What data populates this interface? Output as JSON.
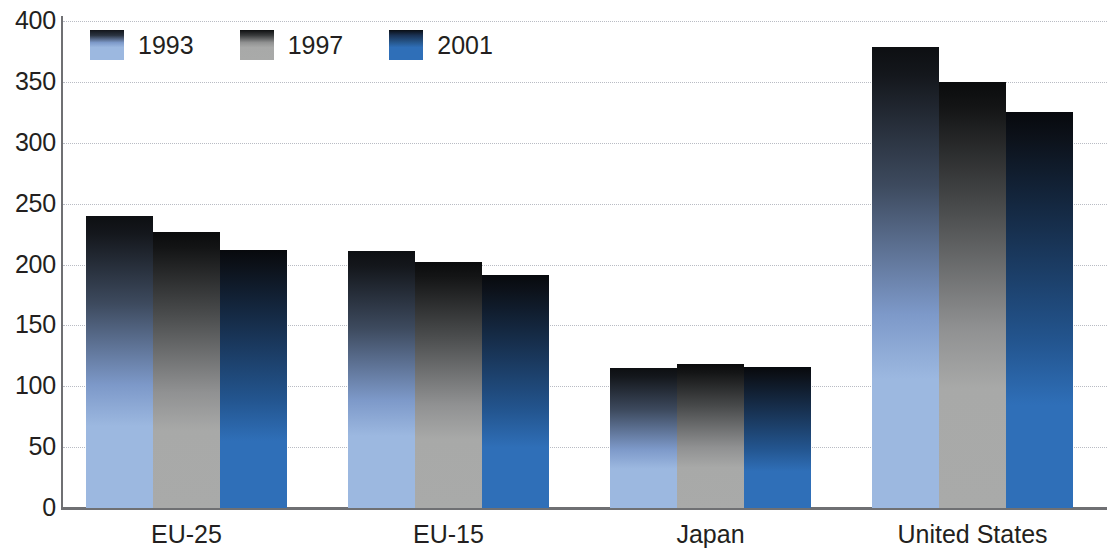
{
  "chart_data": {
    "type": "bar",
    "title": "",
    "subtitle": "",
    "xlabel": "",
    "ylabel": "",
    "categories": [
      "EU-25",
      "EU-15",
      "Japan",
      "United States"
    ],
    "series": [
      {
        "name": "1993",
        "color": "#9cb8e0",
        "values": [
          240,
          211,
          115,
          379
        ]
      },
      {
        "name": "1997",
        "color": "#a8a9a8",
        "values": [
          227,
          202,
          118,
          350
        ]
      },
      {
        "name": "2001",
        "color": "#2f6fb8",
        "values": [
          212,
          191,
          116,
          325
        ]
      }
    ],
    "ylim": [
      0,
      400
    ],
    "yticks": [
      0,
      50,
      100,
      150,
      200,
      250,
      300,
      350,
      400
    ],
    "ytick_labels": [
      "0",
      "50",
      "100",
      "150",
      "200",
      "250",
      "300",
      "350",
      "400"
    ],
    "grid": true,
    "grid_axis": "y",
    "grid_style": "dotted",
    "legend_position": "top-left",
    "legend_entries": [
      "1993",
      "1997",
      "2001"
    ],
    "bar_style": "vertical-gradient-dark-top"
  },
  "axis": {
    "line_color": "#6f7073",
    "grid_color": "#b9bcc4",
    "text_color": "#231f20"
  }
}
